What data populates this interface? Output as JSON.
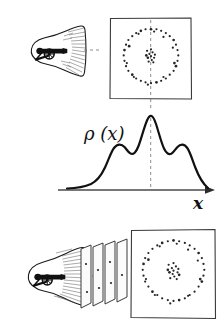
{
  "figure": {
    "background": "#ffffff",
    "ink_color": "#1a1a1a",
    "dash_color": "#6e6e6e",
    "width": 223,
    "height": 333
  },
  "labels": {
    "density": "ρ (x)",
    "axis_x": "x"
  },
  "panels": {
    "top": {
      "name": "single-cannon-to-target",
      "cannon_label": "cannon",
      "target_label": "target-screen",
      "has_center_dashline": true
    },
    "middle": {
      "name": "probability-density-plot",
      "has_center_dashline": true
    },
    "bottom": {
      "name": "cannon-through-plates-to-target",
      "plate_count": 4,
      "has_center_dashline": false
    }
  },
  "chart_data": {
    "type": "line",
    "title": "ρ (x)",
    "xlabel": "x",
    "ylabel": "ρ (x)",
    "grid": false,
    "legend": false,
    "xlim": [
      0,
      1
    ],
    "ylim": [
      0,
      1
    ],
    "annotations": [
      "center dashed line at peak x = 0.5"
    ],
    "x": [
      0.0,
      0.05,
      0.1,
      0.14,
      0.18,
      0.22,
      0.26,
      0.3,
      0.34,
      0.38,
      0.42,
      0.46,
      0.5,
      0.54,
      0.58,
      0.62,
      0.66,
      0.7,
      0.74,
      0.78,
      0.82,
      0.86,
      0.9,
      0.95,
      1.0
    ],
    "y": [
      0.02,
      0.03,
      0.06,
      0.12,
      0.24,
      0.38,
      0.48,
      0.52,
      0.5,
      0.46,
      0.56,
      0.8,
      1.0,
      0.8,
      0.56,
      0.46,
      0.5,
      0.52,
      0.48,
      0.38,
      0.24,
      0.12,
      0.06,
      0.03,
      0.02
    ],
    "peaks": [
      {
        "x": 0.3,
        "y": 0.52,
        "name": "left-shoulder"
      },
      {
        "x": 0.5,
        "y": 1.0,
        "name": "central-peak"
      },
      {
        "x": 0.7,
        "y": 0.52,
        "name": "right-shoulder"
      }
    ]
  },
  "scatter_top": {
    "type": "scatter",
    "name": "top-target-impacts",
    "ring": [
      [
        0.5,
        0.12
      ],
      [
        0.57,
        0.12
      ],
      [
        0.63,
        0.14
      ],
      [
        0.69,
        0.17
      ],
      [
        0.74,
        0.21
      ],
      [
        0.79,
        0.26
      ],
      [
        0.82,
        0.32
      ],
      [
        0.84,
        0.39
      ],
      [
        0.85,
        0.46
      ],
      [
        0.84,
        0.53
      ],
      [
        0.82,
        0.6
      ],
      [
        0.79,
        0.66
      ],
      [
        0.74,
        0.71
      ],
      [
        0.69,
        0.76
      ],
      [
        0.63,
        0.79
      ],
      [
        0.57,
        0.81
      ],
      [
        0.5,
        0.82
      ],
      [
        0.43,
        0.81
      ],
      [
        0.37,
        0.79
      ],
      [
        0.31,
        0.76
      ],
      [
        0.26,
        0.71
      ],
      [
        0.21,
        0.66
      ],
      [
        0.18,
        0.6
      ],
      [
        0.16,
        0.53
      ],
      [
        0.15,
        0.46
      ],
      [
        0.16,
        0.39
      ],
      [
        0.18,
        0.32
      ],
      [
        0.21,
        0.26
      ],
      [
        0.26,
        0.21
      ],
      [
        0.31,
        0.17
      ],
      [
        0.37,
        0.14
      ],
      [
        0.43,
        0.12
      ],
      [
        0.54,
        0.15
      ],
      [
        0.66,
        0.22
      ],
      [
        0.78,
        0.36
      ],
      [
        0.8,
        0.56
      ],
      [
        0.66,
        0.74
      ],
      [
        0.46,
        0.84
      ],
      [
        0.28,
        0.74
      ],
      [
        0.19,
        0.56
      ],
      [
        0.22,
        0.34
      ],
      [
        0.34,
        0.18
      ]
    ],
    "center": [
      [
        0.48,
        0.44
      ],
      [
        0.52,
        0.42
      ],
      [
        0.5,
        0.47
      ],
      [
        0.46,
        0.49
      ],
      [
        0.54,
        0.49
      ],
      [
        0.51,
        0.52
      ],
      [
        0.47,
        0.54
      ],
      [
        0.55,
        0.45
      ],
      [
        0.44,
        0.46
      ],
      [
        0.5,
        0.38
      ],
      [
        0.53,
        0.55
      ],
      [
        0.45,
        0.4
      ]
    ]
  },
  "scatter_bottom": {
    "type": "scatter",
    "name": "bottom-target-impacts",
    "ring": [
      [
        0.5,
        0.1
      ],
      [
        0.57,
        0.11
      ],
      [
        0.64,
        0.13
      ],
      [
        0.7,
        0.16
      ],
      [
        0.76,
        0.2
      ],
      [
        0.81,
        0.25
      ],
      [
        0.85,
        0.31
      ],
      [
        0.87,
        0.38
      ],
      [
        0.88,
        0.45
      ],
      [
        0.87,
        0.52
      ],
      [
        0.85,
        0.59
      ],
      [
        0.81,
        0.65
      ],
      [
        0.76,
        0.71
      ],
      [
        0.7,
        0.75
      ],
      [
        0.64,
        0.79
      ],
      [
        0.57,
        0.81
      ],
      [
        0.5,
        0.82
      ],
      [
        0.43,
        0.81
      ],
      [
        0.36,
        0.79
      ],
      [
        0.3,
        0.75
      ],
      [
        0.24,
        0.71
      ],
      [
        0.19,
        0.65
      ],
      [
        0.15,
        0.59
      ],
      [
        0.13,
        0.52
      ],
      [
        0.12,
        0.45
      ],
      [
        0.13,
        0.38
      ],
      [
        0.15,
        0.31
      ],
      [
        0.19,
        0.25
      ],
      [
        0.24,
        0.2
      ],
      [
        0.3,
        0.16
      ],
      [
        0.36,
        0.13
      ],
      [
        0.43,
        0.11
      ],
      [
        0.54,
        0.14
      ],
      [
        0.68,
        0.21
      ],
      [
        0.8,
        0.34
      ],
      [
        0.83,
        0.56
      ],
      [
        0.68,
        0.76
      ],
      [
        0.46,
        0.85
      ],
      [
        0.27,
        0.75
      ],
      [
        0.16,
        0.56
      ],
      [
        0.19,
        0.33
      ],
      [
        0.33,
        0.17
      ]
    ],
    "center": [
      [
        0.48,
        0.43
      ],
      [
        0.53,
        0.41
      ],
      [
        0.5,
        0.46
      ],
      [
        0.45,
        0.48
      ],
      [
        0.55,
        0.48
      ],
      [
        0.51,
        0.53
      ],
      [
        0.46,
        0.55
      ],
      [
        0.56,
        0.44
      ],
      [
        0.43,
        0.45
      ],
      [
        0.5,
        0.37
      ],
      [
        0.54,
        0.56
      ],
      [
        0.44,
        0.39
      ],
      [
        0.49,
        0.5
      ],
      [
        0.57,
        0.51
      ]
    ]
  },
  "plates": {
    "name": "stacked-plates",
    "dots_per_plate": [
      1,
      2,
      2,
      2
    ]
  }
}
